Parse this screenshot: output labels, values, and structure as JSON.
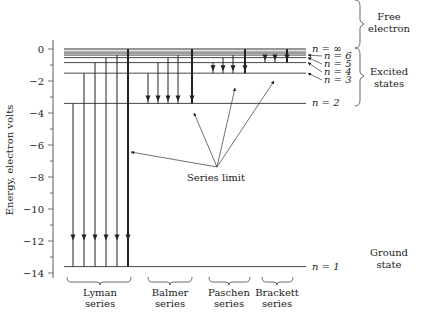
{
  "chart_data": {
    "type": "diagram",
    "ylabel": "Energy, electron volts",
    "ylim": [
      -14,
      0
    ],
    "yticks": [
      0,
      -2,
      -4,
      -6,
      -8,
      -10,
      -12,
      -14
    ],
    "ytick_labels": [
      "0",
      "−2",
      "−4",
      "−6",
      "−8",
      "−10",
      "−12",
      "−14"
    ],
    "levels": [
      {
        "n": "1",
        "label": "n = 1",
        "energy": -13.6
      },
      {
        "n": "2",
        "label": "n = 2",
        "energy": -3.4
      },
      {
        "n": "3",
        "label": "n = 3",
        "energy": -1.51
      },
      {
        "n": "4",
        "label": "n = 4",
        "energy": -0.85
      },
      {
        "n": "5",
        "label": "n = 5",
        "energy": -0.54
      },
      {
        "n": "6",
        "label": "n = 6",
        "energy": -0.38
      },
      {
        "n": "inf",
        "label": "n = ∞",
        "energy": 0
      }
    ],
    "series": [
      {
        "name": "Lyman series",
        "line1": "Lyman",
        "line2": "series",
        "final_n": 1,
        "from_n": [
          "2",
          "3",
          "4",
          "5",
          "6",
          "inf"
        ]
      },
      {
        "name": "Balmer series",
        "line1": "Balmer",
        "line2": "series",
        "final_n": 2,
        "from_n": [
          "3",
          "4",
          "5",
          "6",
          "inf"
        ]
      },
      {
        "name": "Paschen series",
        "line1": "Paschen",
        "line2": "series",
        "final_n": 3,
        "from_n": [
          "4",
          "5",
          "6",
          "inf"
        ]
      },
      {
        "name": "Brackett series",
        "line1": "Brackett",
        "line2": "series",
        "final_n": 4,
        "from_n": [
          "5",
          "6",
          "inf"
        ]
      }
    ],
    "annotations": {
      "series_limit": "Series limit",
      "free_electron": [
        "Free",
        "electron"
      ],
      "excited_states": [
        "Excited",
        "states"
      ],
      "ground_state": [
        "Ground",
        "state"
      ]
    }
  }
}
